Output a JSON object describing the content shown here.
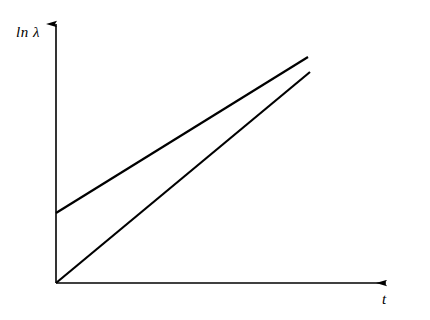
{
  "figure": {
    "background_color": "#ffffff",
    "stroke_color": "#000000",
    "axis_label_y": "ln λ",
    "axis_label_x": "t"
  },
  "chart_data": {
    "type": "line",
    "title": "",
    "subtitle": "",
    "xlabel": "t",
    "ylabel": "ln λ",
    "grid": false,
    "legend": "none",
    "axis_style": "arrow-ended half-frame (L-shaped), no tick marks, no tick labels",
    "xlim": [
      0,
      1
    ],
    "ylim": [
      0,
      1
    ],
    "x_tick_labels": [],
    "y_tick_labels": [],
    "annotations": [],
    "series": [
      {
        "name": "upper-line",
        "description": "straight line with positive y-intercept and shallower slope",
        "x": [
          0.0,
          1.0
        ],
        "y": [
          0.31,
          1.0
        ],
        "y_intercept": 0.31,
        "slope": 0.69,
        "pixel_points": [
          [
            56,
            213
          ],
          [
            308,
            57
          ]
        ]
      },
      {
        "name": "lower-line",
        "description": "straight line through the origin with steeper slope",
        "x": [
          0.0,
          1.0
        ],
        "y": [
          0.0,
          0.94
        ],
        "y_intercept": 0.0,
        "slope": 0.94,
        "pixel_points": [
          [
            56,
            283
          ],
          [
            310,
            72
          ]
        ]
      }
    ]
  },
  "geometry": {
    "origin": {
      "x": 56,
      "y": 283
    },
    "y_axis": {
      "x1": 56,
      "y1": 283,
      "x2": 56,
      "y2": 22
    },
    "x_axis": {
      "x1": 56,
      "y1": 283,
      "x2": 388,
      "y2": 283
    },
    "upper_line": {
      "x1": 56,
      "y1": 213,
      "x2": 308,
      "y2": 57
    },
    "lower_line": {
      "x1": 56,
      "y1": 283,
      "x2": 310,
      "y2": 72
    },
    "stroke_width_axis": 1.6,
    "stroke_width_data": 2.2
  }
}
